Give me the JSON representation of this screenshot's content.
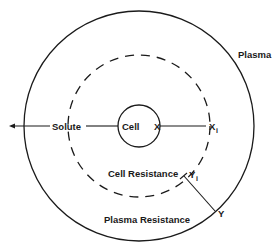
{
  "diagram": {
    "type": "concentric-resistance-model",
    "colors": {
      "stroke": "#1a1a1a",
      "background": "#ffffff"
    },
    "labels": {
      "plasma": "Plasma",
      "solute": "Solute",
      "cell": "Cell",
      "x": "X",
      "x_i_main": "X",
      "x_i_sub": "i",
      "cell_resistance": "Cell Resistance",
      "y_i_main": "Y",
      "y_i_sub": "i",
      "y": "Y",
      "plasma_resistance": "Plasma Resistance"
    },
    "shapes": {
      "outer_circle": "plasma boundary (solid)",
      "middle_circle": "cell resistance boundary (dashed)",
      "inner_circle": "cell (solid)",
      "solute_arrow": "arrow pointing left from cell outward"
    }
  }
}
